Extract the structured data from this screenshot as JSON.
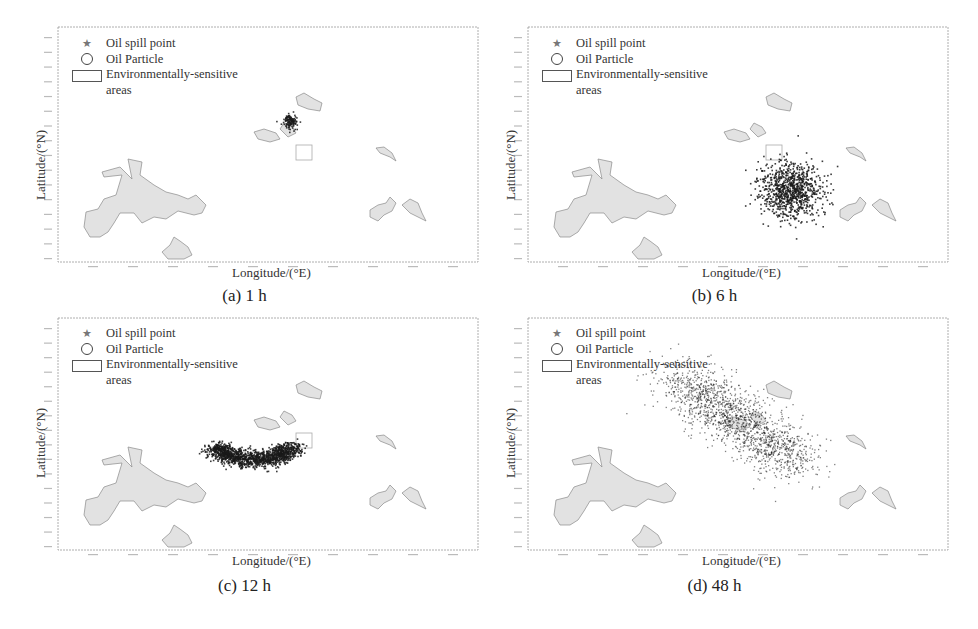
{
  "figure": {
    "legend": {
      "oil_spill_point": "Oil spill point",
      "oil_particle": "Oil Particle",
      "sensitive_area_line1": "Environmentally-sensitive",
      "sensitive_area_line2": "areas"
    },
    "xlabel": "Longitude/(°E)",
    "ylabel": "Latitude/(°N)",
    "colors": {
      "frame": "#9a9a9a",
      "land_fill": "#e2e2e2",
      "land_edge": "#8a8a8a",
      "particle": "#1a1a1a",
      "sensitive_box": "#aaaaaa"
    },
    "panels": [
      {
        "id": "a",
        "caption": "(a) 1 h",
        "cloud": {
          "type": "blob",
          "cx": 232,
          "cy": 94,
          "rx": 5,
          "ry": 5,
          "n": 120,
          "spread": 0.7
        }
      },
      {
        "id": "b",
        "caption": "(b) 6 h",
        "cloud": {
          "type": "blob",
          "cx": 262,
          "cy": 162,
          "rx": 20,
          "ry": 18,
          "n": 900,
          "spread": 0.8
        }
      },
      {
        "id": "c",
        "caption": "(c) 12 h",
        "cloud": {
          "type": "arc",
          "cx": 195,
          "cy": 130,
          "rx": 38,
          "ry": 16,
          "n": 1400
        }
      },
      {
        "id": "d",
        "caption": "(d) 48 h",
        "cloud": {
          "type": "band",
          "x1": 150,
          "y1": 60,
          "x2": 270,
          "y2": 145,
          "width": 38,
          "n": 1600
        }
      }
    ]
  }
}
